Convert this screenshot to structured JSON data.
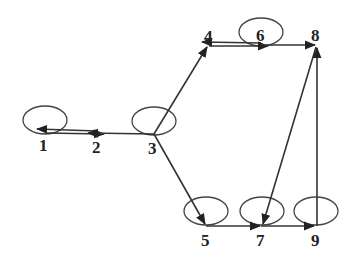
{
  "diagram": {
    "type": "directed-graph",
    "nodes": [
      {
        "id": "1",
        "label": "1",
        "x": 45,
        "y": 131,
        "self_loop": true
      },
      {
        "id": "2",
        "label": "2",
        "x": 97,
        "y": 133,
        "self_loop": false
      },
      {
        "id": "3",
        "label": "3",
        "x": 154,
        "y": 134,
        "self_loop": true
      },
      {
        "id": "4",
        "label": "4",
        "x": 209,
        "y": 44,
        "self_loop": false
      },
      {
        "id": "6",
        "label": "6",
        "x": 261,
        "y": 45,
        "self_loop": true
      },
      {
        "id": "8",
        "label": "8",
        "x": 316,
        "y": 45,
        "self_loop": false
      },
      {
        "id": "5",
        "label": "5",
        "x": 206,
        "y": 226,
        "self_loop": true
      },
      {
        "id": "7",
        "label": "7",
        "x": 261,
        "y": 226,
        "self_loop": true
      },
      {
        "id": "9",
        "label": "9",
        "x": 316,
        "y": 226,
        "self_loop": true
      }
    ],
    "edges": [
      {
        "from": "2",
        "to": "1"
      },
      {
        "from": "1",
        "to": "2"
      },
      {
        "from": "3",
        "to": "2"
      },
      {
        "from": "3",
        "to": "4"
      },
      {
        "from": "3",
        "to": "5"
      },
      {
        "from": "6",
        "to": "4"
      },
      {
        "from": "4",
        "to": "6"
      },
      {
        "from": "6",
        "to": "8"
      },
      {
        "from": "5",
        "to": "7"
      },
      {
        "from": "7",
        "to": "9"
      },
      {
        "from": "8",
        "to": "7"
      },
      {
        "from": "9",
        "to": "8"
      }
    ]
  }
}
